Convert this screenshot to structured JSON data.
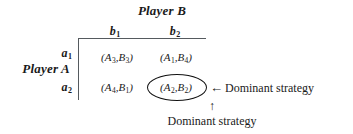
{
  "diagram": {
    "type": "game-theory-payoff-matrix",
    "column_player": {
      "title": "Player B",
      "strategies": [
        {
          "label": "b",
          "subscript": "1"
        },
        {
          "label": "b",
          "subscript": "2"
        }
      ]
    },
    "row_player": {
      "title": "Player A",
      "strategies": [
        {
          "label": "a",
          "subscript": "1"
        },
        {
          "label": "a",
          "subscript": "2"
        }
      ]
    },
    "cells": [
      {
        "row": "a1",
        "col": "b1",
        "open": "(",
        "a": "A",
        "a_sub": "3",
        "comma": ",",
        "b": "B",
        "b_sub": "3",
        "close": ")",
        "highlighted": false
      },
      {
        "row": "a1",
        "col": "b2",
        "open": "(",
        "a": "A",
        "a_sub": "1",
        "comma": ",",
        "b": "B",
        "b_sub": "4",
        "close": ")",
        "highlighted": false
      },
      {
        "row": "a2",
        "col": "b1",
        "open": "(",
        "a": "A",
        "a_sub": "4",
        "comma": ",",
        "b": "B",
        "b_sub": "1",
        "close": ")",
        "highlighted": false
      },
      {
        "row": "a2",
        "col": "b2",
        "open": "(",
        "a": "A",
        "a_sub": "2",
        "comma": ",",
        "b": "B",
        "b_sub": "2",
        "close": ")",
        "highlighted": true
      }
    ],
    "annotations": {
      "row_annotation": {
        "arrow": "←",
        "text": "Dominant strategy"
      },
      "column_annotation": {
        "arrow": "↑",
        "text": "Dominant strategy"
      }
    },
    "colors": {
      "rule": "#555a5e",
      "ellipse": "#111111",
      "text": "#1a1a1a",
      "background": "#ffffff"
    }
  }
}
